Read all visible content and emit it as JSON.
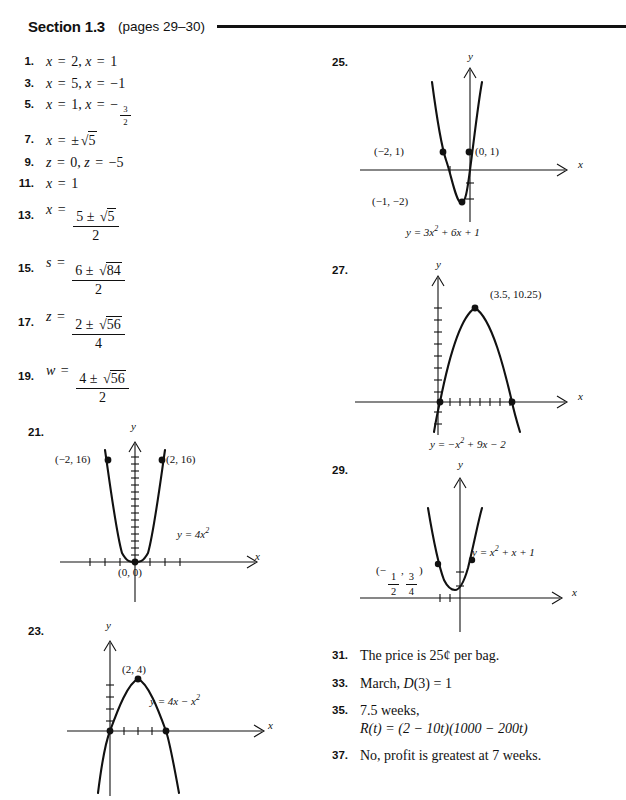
{
  "header": {
    "section": "Section 1.3",
    "pages": "(pages 29–30)"
  },
  "left_column": {
    "answers": [
      {
        "num": "1.",
        "type": "text"
      },
      {
        "num": "3.",
        "type": "text"
      },
      {
        "num": "5.",
        "type": "text"
      },
      {
        "num": "7.",
        "type": "text"
      },
      {
        "num": "9.",
        "type": "text"
      },
      {
        "num": "11.",
        "type": "text"
      },
      {
        "num": "13.",
        "type": "frac"
      },
      {
        "num": "15.",
        "type": "frac"
      },
      {
        "num": "17.",
        "type": "frac"
      },
      {
        "num": "19.",
        "type": "frac"
      }
    ],
    "a1": {
      "num": "1.",
      "var": "x",
      "v1": "2",
      "v2": "1"
    },
    "a3": {
      "num": "3.",
      "var": "x",
      "v1": "5",
      "v2": "−1"
    },
    "a5": {
      "num": "5.",
      "var": "x",
      "v1": "1",
      "fnum": "3",
      "fden": "2",
      "sign": "−"
    },
    "a7": {
      "num": "7.",
      "var": "x",
      "pm": "±",
      "radicand": "5"
    },
    "a9": {
      "num": "9.",
      "var": "z",
      "v1": "0",
      "v2": "−5"
    },
    "a11": {
      "num": "11.",
      "var": "x",
      "v1": "1"
    },
    "a13": {
      "num": "13.",
      "var": "x",
      "lead": "5",
      "pm": "±",
      "radicand": "5",
      "den": "2"
    },
    "a15": {
      "num": "15.",
      "var": "s",
      "lead": "6",
      "pm": "±",
      "radicand": "84",
      "den": "2"
    },
    "a17": {
      "num": "17.",
      "var": "z",
      "lead": "2",
      "pm": "±",
      "radicand": "56",
      "den": "4"
    },
    "a19": {
      "num": "19.",
      "var": "w",
      "lead": "4",
      "pm": "±",
      "radicand": "56",
      "den": "2"
    },
    "eq": "=",
    "comma": ","
  },
  "graphs": {
    "g21": {
      "num": "21.",
      "equation_base": "y = 4x",
      "equation_exp": "2",
      "x_axis_label": "x",
      "y_axis_label": "y",
      "points": [
        {
          "label": "(−2, 16)",
          "x": -2,
          "y": 16
        },
        {
          "label": "(2, 16)",
          "x": 2,
          "y": 16
        },
        {
          "label": "(0, 0)",
          "x": 0,
          "y": 0
        }
      ],
      "x_ticks": 7,
      "y_ticks": 16
    },
    "g23": {
      "num": "23.",
      "equation_base": "y = 4x − x",
      "equation_exp": "2",
      "x_axis_label": "x",
      "y_axis_label": "y",
      "points": [
        {
          "label": "(2, 4)",
          "x": 2,
          "y": 4
        },
        {
          "label": "",
          "x": 0,
          "y": 0
        },
        {
          "label": "",
          "x": 4,
          "y": 0
        }
      ],
      "x_ticks": 4,
      "y_ticks": 4
    },
    "g25": {
      "num": "25.",
      "equation_base": "y = 3x",
      "equation_exp": "2",
      "equation_tail": " + 6x + 1",
      "x_axis_label": "x",
      "y_axis_label": "y",
      "points": [
        {
          "label": "(−2, 1)",
          "x": -2,
          "y": 1
        },
        {
          "label": "(0, 1)",
          "x": 0,
          "y": 1
        },
        {
          "label": "(−1, −2)",
          "x": -1,
          "y": -2
        }
      ],
      "x_ticks": 2,
      "y_ticks": 3
    },
    "g27": {
      "num": "27.",
      "equation_base": "y = −x",
      "equation_exp": "2",
      "equation_tail": " + 9x − 2",
      "x_axis_label": "x",
      "y_axis_label": "y",
      "points": [
        {
          "label": "(3.5, 10.25)",
          "x": 3.5,
          "y": 10.25
        }
      ],
      "x_ticks": 8,
      "y_ticks": 12
    },
    "g29": {
      "num": "29.",
      "equation_base": "y = x",
      "equation_exp": "2",
      "equation_tail": " + x + 1",
      "x_axis_label": "x",
      "y_axis_label": "y",
      "vertex": {
        "open": "(",
        "xnum": "1",
        "xden": "2",
        "xsign": "−",
        "comma": ",",
        "ynum": "3",
        "yden": "4",
        "close": ")"
      },
      "x_ticks": 2,
      "y_ticks": 2
    }
  },
  "right_column": {
    "a31": {
      "num": "31.",
      "text": "The price is 25¢ per bag."
    },
    "a33": {
      "num": "33.",
      "pre": "March, ",
      "fn": "D",
      "arg": "(3)",
      "eq": " = 1"
    },
    "a35": {
      "num": "35.",
      "line1": "7.5 weeks,",
      "fn": "R",
      "arg": "(t)",
      "rest": " = (2 − 10t)(1000 − 200t)"
    },
    "a37": {
      "num": "37.",
      "text": "No, profit is greatest at 7 weeks."
    }
  }
}
